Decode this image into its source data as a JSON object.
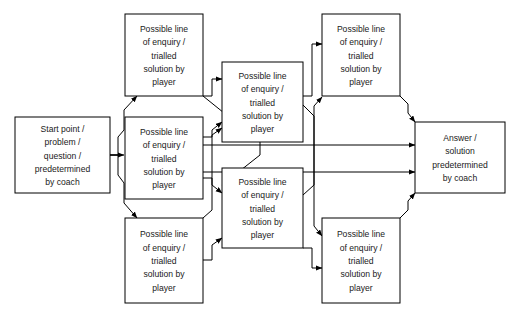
{
  "diagram": {
    "type": "flowchart",
    "canvas": {
      "width": 522,
      "height": 320,
      "background": "#ffffff"
    },
    "line_color": "#000000",
    "text_color": "#1a1a1a",
    "node_fill": "#ffffff",
    "nodes": [
      {
        "id": "start",
        "name": "start-node",
        "lines": [
          "Start point /",
          "problem /",
          "question /",
          "predetermined",
          "by coach"
        ],
        "x": 15,
        "y": 117,
        "w": 95,
        "h": 76
      },
      {
        "id": "branch-1",
        "name": "branch-node-1",
        "lines": [
          "Possible line",
          "of enquiry /",
          "trialled",
          "solution by",
          "player"
        ],
        "x": 125,
        "y": 14,
        "w": 78,
        "h": 82
      },
      {
        "id": "branch-2",
        "name": "branch-node-2",
        "lines": [
          "Possible line",
          "of enquiry /",
          "trialled",
          "solution by",
          "player"
        ],
        "x": 125,
        "y": 117,
        "w": 78,
        "h": 82
      },
      {
        "id": "branch-3",
        "name": "branch-node-3",
        "lines": [
          "Possible line",
          "of enquiry /",
          "trialled",
          "solution by",
          "player"
        ],
        "x": 125,
        "y": 218,
        "w": 78,
        "h": 85
      },
      {
        "id": "branch-4",
        "name": "branch-node-4",
        "lines": [
          "Possible line",
          "of enquiry /",
          "trialled",
          "solution by",
          "player"
        ],
        "x": 222,
        "y": 62,
        "w": 81,
        "h": 80
      },
      {
        "id": "branch-5",
        "name": "branch-node-5",
        "lines": [
          "Possible line",
          "of enquiry /",
          "trialled",
          "solution by",
          "player"
        ],
        "x": 222,
        "y": 168,
        "w": 81,
        "h": 80
      },
      {
        "id": "branch-6",
        "name": "branch-node-6",
        "lines": [
          "Possible line",
          "of enquiry /",
          "trialled",
          "solution by",
          "player"
        ],
        "x": 322,
        "y": 14,
        "w": 78,
        "h": 82
      },
      {
        "id": "branch-7",
        "name": "branch-node-7",
        "lines": [
          "Possible line",
          "of enquiry /",
          "trialled",
          "solution by",
          "player"
        ],
        "x": 322,
        "y": 218,
        "w": 78,
        "h": 85
      },
      {
        "id": "answer",
        "name": "answer-node",
        "lines": [
          "Answer /",
          "solution",
          "predetermined",
          "by coach"
        ],
        "x": 415,
        "y": 122,
        "w": 90,
        "h": 71
      }
    ],
    "edges": [
      {
        "name": "edge-start-to-branch1",
        "points": "110,155 118,155 118,137 124,130 124,110 137,96",
        "arrow": true
      },
      {
        "name": "edge-start-to-branch2",
        "points": "110,155 124,155",
        "arrow": true
      },
      {
        "name": "edge-start-to-branch3",
        "points": "110,155 118,155 118,175 124,183 124,203 137,218",
        "arrow": true
      },
      {
        "name": "edge-branch1-to-branch4",
        "points": "203,96 212,96 212,79 222,79",
        "arrow": true
      },
      {
        "name": "edge-branch1-to-branch5",
        "points": "203,96 260,142 260,155 222,185",
        "arrow": true
      },
      {
        "name": "edge-branch2-to-branch4",
        "points": "203,137 212,137 212,130 222,122",
        "arrow": true
      },
      {
        "name": "edge-branch2-to-branch5",
        "points": "203,178 212,178 212,185 222,193",
        "arrow": true
      },
      {
        "name": "edge-branch3-to-branch4",
        "points": "203,218 212,210 212,135 222,128",
        "arrow": true
      },
      {
        "name": "edge-branch3-to-branch5",
        "points": "203,260 212,260 212,245 222,238",
        "arrow": true
      },
      {
        "name": "edge-branch4-to-branch6",
        "points": "303,96 312,96 312,44 322,44",
        "arrow": true
      },
      {
        "name": "edge-branch4-to-branch7",
        "points": "303,105 314,116 314,226 322,236",
        "arrow": true
      },
      {
        "name": "edge-branch5-to-branch6",
        "points": "303,195 314,185 314,106 322,97",
        "arrow": true
      },
      {
        "name": "edge-branch5-to-branch7",
        "points": "303,248 312,248 312,268 322,268",
        "arrow": true
      },
      {
        "name": "edge-branch6-to-answer",
        "points": "400,96 408,104 408,113 415,122",
        "arrow": true
      },
      {
        "name": "edge-mid-upper-to-answer",
        "points": "203,145 415,145",
        "arrow": true
      },
      {
        "name": "edge-mid-lower-to-answer",
        "points": "203,172 415,172",
        "arrow": true
      },
      {
        "name": "edge-branch7-to-answer",
        "points": "400,218 408,210 408,201 415,193",
        "arrow": true
      }
    ]
  }
}
